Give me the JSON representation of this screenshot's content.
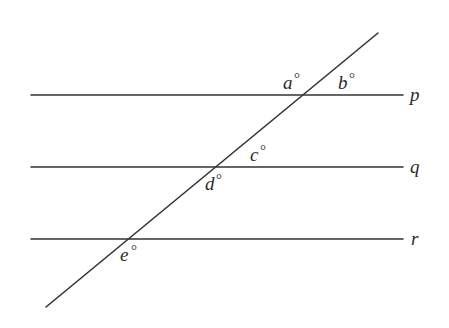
{
  "diagram": {
    "lines": [
      {
        "id": "p",
        "label": "p",
        "y": 95
      },
      {
        "id": "q",
        "label": "q",
        "y": 167
      },
      {
        "id": "r",
        "label": "r",
        "y": 239
      }
    ],
    "transversal": {
      "x1": 378,
      "y1": 33,
      "x2": 46,
      "y2": 307
    },
    "angles": [
      {
        "id": "a",
        "label": "a",
        "degree_symbol": "°",
        "line": "p",
        "position": "above-left"
      },
      {
        "id": "b",
        "label": "b",
        "degree_symbol": "°",
        "line": "p",
        "position": "above-right"
      },
      {
        "id": "c",
        "label": "c",
        "degree_symbol": "°",
        "line": "q",
        "position": "above-right"
      },
      {
        "id": "d",
        "label": "d",
        "degree_symbol": "°",
        "line": "q",
        "position": "below-left"
      },
      {
        "id": "e",
        "label": "e",
        "degree_symbol": "°",
        "line": "r",
        "position": "below-left"
      }
    ],
    "colors": {
      "stroke": "#333333",
      "text": "#2a2a2a",
      "background": "#ffffff"
    }
  }
}
